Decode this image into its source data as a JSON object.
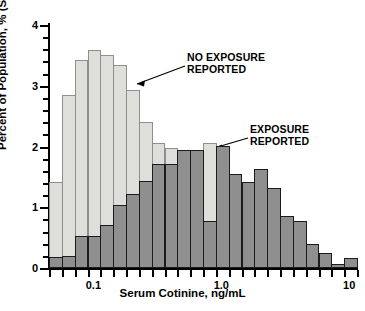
{
  "chart_data": {
    "type": "bar",
    "title": "",
    "subtitle": "",
    "xlabel": "Serum Cotinine, ng/mL",
    "ylabel": "Percent of Population, %  (Smokers + Nonsmokers)",
    "xscale": "log",
    "xlim": [
      0.045,
      11.5
    ],
    "ylim": [
      0,
      4
    ],
    "grid": false,
    "legend_position": "inline-annotations",
    "x_tick_labels": [
      "0.1",
      "1.0",
      "10"
    ],
    "x_tick_values": [
      0.1,
      1.0,
      10
    ],
    "y_tick_labels": [
      "0",
      "1",
      "2",
      "3",
      "4"
    ],
    "y_tick_values": [
      0,
      1,
      2,
      3,
      4
    ],
    "y_minor_step": 0.2,
    "bin_index": [
      0,
      1,
      2,
      3,
      4,
      5,
      6,
      7,
      8,
      9,
      10,
      11,
      12,
      13,
      14,
      15,
      16,
      17,
      18,
      19,
      20,
      21,
      22,
      23
    ],
    "series": [
      {
        "name": "NO EXPOSURE REPORTED",
        "color": "#dededa",
        "edge_color": "#8e8e8a",
        "values": [
          1.42,
          2.84,
          3.43,
          3.59,
          3.51,
          3.35,
          2.93,
          2.4,
          2.05,
          1.97,
          1.95,
          1.08,
          2.06,
          2.01,
          0.9,
          0.5,
          0.33,
          0.28,
          0.16,
          0.16,
          0.05,
          0.04,
          0.04,
          0.03
        ]
      },
      {
        "name": "EXPOSURE REPORTED",
        "color": "#8f8f8f",
        "edge_color": "#1b1b1b",
        "values": [
          0.18,
          0.19,
          0.52,
          0.52,
          0.7,
          1.03,
          1.22,
          1.43,
          1.71,
          1.72,
          1.95,
          1.95,
          0.78,
          2.01,
          1.54,
          1.42,
          1.63,
          1.31,
          0.86,
          0.78,
          0.4,
          0.25,
          0.07,
          0.17
        ]
      }
    ],
    "annotations": [
      {
        "name": "no-exposure-callout",
        "text": "NO EXPOSURE\nREPORTED"
      },
      {
        "name": "exposure-callout",
        "text": "EXPOSURE\nREPORTED"
      }
    ]
  }
}
